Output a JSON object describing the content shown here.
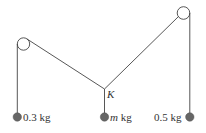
{
  "diagram": {
    "type": "pulley-system",
    "colors": {
      "line": "#444444",
      "mass": "#666666",
      "background": "#ffffff"
    },
    "junction": {
      "label": "K",
      "x": 104.5,
      "y": 89
    },
    "pulleys": [
      {
        "name": "left-pulley",
        "cx": 23.5,
        "cy": 44,
        "r": 6.2
      },
      {
        "name": "right-pulley",
        "cx": 183.5,
        "cy": 13,
        "r": 6.3
      }
    ],
    "masses": [
      {
        "name": "left-mass",
        "label_value": "0.3",
        "label_unit": " kg",
        "x": 17.3,
        "y": 117
      },
      {
        "name": "middle-mass",
        "label_value": "m",
        "label_unit": " kg",
        "x": 104.5,
        "y": 117
      },
      {
        "name": "right-mass",
        "label_value": "0.5",
        "label_unit": " kg",
        "x": 189.8,
        "y": 117
      }
    ]
  }
}
